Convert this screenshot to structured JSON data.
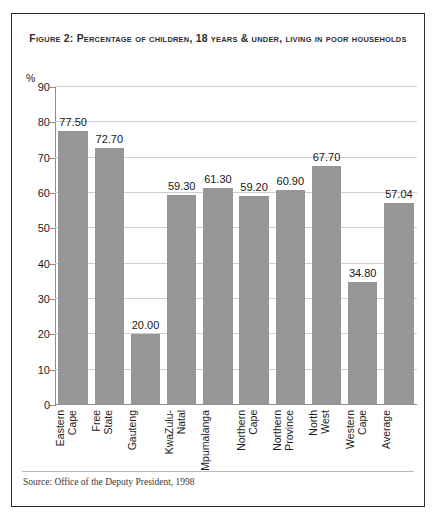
{
  "figure": {
    "title": "Figure 2: Percentage of children, 18 years & under, living in poor households",
    "source": "Source: Office of the Deputy President, 1998"
  },
  "chart_data": {
    "type": "bar",
    "title": "Figure 2: Percentage of children, 18 years & under, living in poor households",
    "xlabel": "",
    "ylabel": "%",
    "ylim": [
      0,
      90
    ],
    "yticks": [
      0,
      10,
      20,
      30,
      40,
      50,
      60,
      70,
      80,
      90
    ],
    "grid": true,
    "legend": "none",
    "bar_color": "#969696",
    "categories": [
      "Eastern Cape",
      "Free State",
      "Gauteng",
      "KwaZulu-Natal",
      "Mpumalanga",
      "Northern Cape",
      "Northern Province",
      "North West",
      "Western Cape",
      "Average"
    ],
    "category_label_lines": [
      "Eastern\nCape",
      "Free\nState",
      "Gauteng",
      "KwaZulu-\nNatal",
      "Mpumalanga",
      "Northern\nCape",
      "Northern\nProvince",
      "North\nWest",
      "Western\nCape",
      "Average"
    ],
    "values": [
      77.5,
      72.7,
      20.0,
      59.3,
      61.3,
      59.2,
      60.9,
      67.7,
      34.8,
      57.04
    ],
    "value_labels": [
      "77.50",
      "72.70",
      "20.00",
      "59.30",
      "61.30",
      "59.20",
      "60.90",
      "67.70",
      "34.80",
      "57.04"
    ]
  }
}
